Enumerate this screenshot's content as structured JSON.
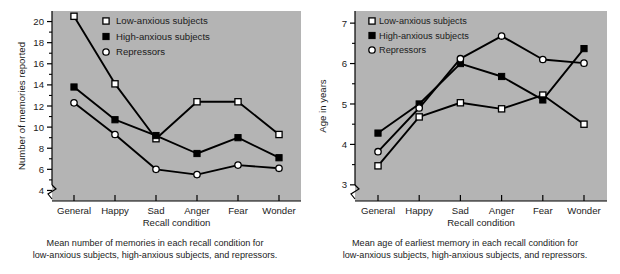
{
  "charts": [
    {
      "id": "memories-chart",
      "xlabel": "Recall condition",
      "ylabel": "Number of memories reported",
      "caption_line1": "Mean number of memories in each recall condition for",
      "caption_line2": "low-anxious subjects, high-anxious subjects, and repressors.",
      "legend": [
        {
          "label": "Low-anxious subjects",
          "marker": "open-square"
        },
        {
          "label": "High-anxious subjects",
          "marker": "filled-square"
        },
        {
          "label": "Repressors",
          "marker": "open-circle"
        }
      ],
      "yticks": [
        "4",
        "6",
        "8",
        "10",
        "12",
        "14",
        "16",
        "18",
        "20"
      ],
      "xticks": [
        "General",
        "Happy",
        "Sad",
        "Anger",
        "Fear",
        "Wonder"
      ]
    },
    {
      "id": "age-chart",
      "xlabel": "Recall condition",
      "ylabel": "Age in years",
      "caption_line1": "Mean age of earliest memory in each recall condition for",
      "caption_line2": "low-anxious subjects, high-anxious subjects, and repressors.",
      "legend": [
        {
          "label": "Low-anxious subjects",
          "marker": "open-square"
        },
        {
          "label": "High-anxious subjects",
          "marker": "filled-square"
        },
        {
          "label": "Repressors",
          "marker": "open-circle"
        }
      ],
      "yticks": [
        "3",
        "4",
        "5",
        "6",
        "7"
      ],
      "xticks": [
        "General",
        "Happy",
        "Sad",
        "Anger",
        "Fear",
        "Wonder"
      ]
    }
  ],
  "colors": {
    "plot_background": "#b4b4b4",
    "page_background": "#ffffff",
    "line": "#000000",
    "text": "#1b1b1b",
    "marker_fill_open": "#ffffff",
    "marker_fill_closed": "#000000"
  },
  "chart_data": [
    {
      "type": "line",
      "title": "",
      "xlabel": "Recall condition",
      "ylabel": "Number of memories reported",
      "categories": [
        "General",
        "Happy",
        "Sad",
        "Anger",
        "Fear",
        "Wonder"
      ],
      "ylim": [
        3.0,
        21.0
      ],
      "yticks": [
        4,
        6,
        8,
        10,
        12,
        14,
        16,
        18,
        20
      ],
      "axis_break": true,
      "grid": false,
      "legend_position": "top-center",
      "series": [
        {
          "name": "Low-anxious subjects",
          "marker": "open-square",
          "values": [
            20.5,
            14.1,
            8.9,
            12.4,
            12.4,
            9.3
          ]
        },
        {
          "name": "High-anxious subjects",
          "marker": "filled-square",
          "values": [
            13.8,
            10.7,
            9.2,
            7.5,
            9.0,
            7.1
          ]
        },
        {
          "name": "Repressors",
          "marker": "open-circle",
          "values": [
            12.3,
            9.3,
            6.0,
            5.5,
            6.4,
            6.1
          ]
        }
      ]
    },
    {
      "type": "line",
      "title": "",
      "xlabel": "Recall condition",
      "ylabel": "Age in years",
      "categories": [
        "General",
        "Happy",
        "Sad",
        "Anger",
        "Fear",
        "Wonder"
      ],
      "ylim": [
        2.6,
        7.3
      ],
      "yticks": [
        3,
        4,
        5,
        6,
        7
      ],
      "axis_break": true,
      "grid": false,
      "legend_position": "top-left",
      "series": [
        {
          "name": "Low-anxious subjects",
          "marker": "open-square",
          "values": [
            3.47,
            4.68,
            5.03,
            4.88,
            5.22,
            4.5
          ]
        },
        {
          "name": "High-anxious subjects",
          "marker": "filled-square",
          "values": [
            4.28,
            5.0,
            6.0,
            5.68,
            5.1,
            6.37
          ]
        },
        {
          "name": "Repressors",
          "marker": "open-circle",
          "values": [
            3.82,
            4.9,
            6.12,
            6.68,
            6.1,
            6.01
          ]
        }
      ]
    }
  ]
}
